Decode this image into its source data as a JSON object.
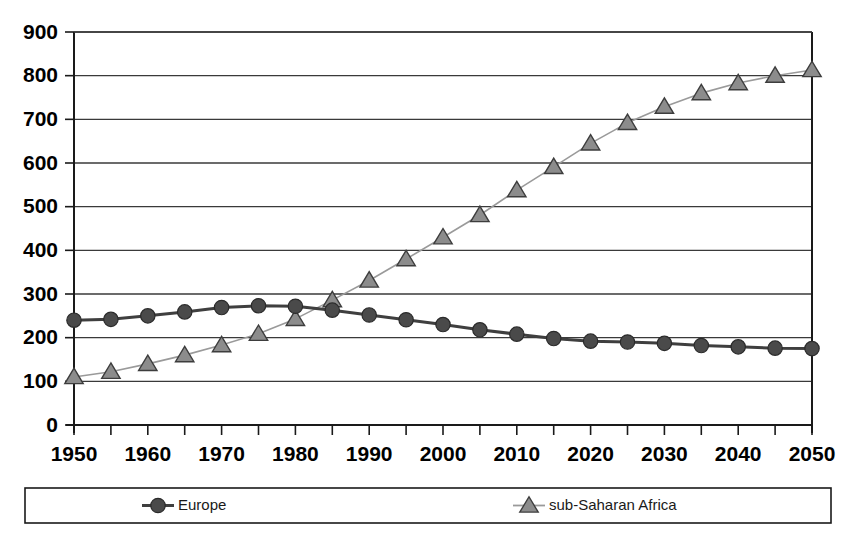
{
  "chart_data": {
    "type": "line",
    "title": "",
    "subtitle": "",
    "xlabel": "",
    "ylabel": "",
    "xlim": [
      1950,
      2050
    ],
    "ylim": [
      0,
      900
    ],
    "grid": true,
    "legend_position": "bottom",
    "x": [
      1950,
      1955,
      1960,
      1965,
      1970,
      1975,
      1980,
      1985,
      1990,
      1995,
      2000,
      2005,
      2010,
      2015,
      2020,
      2025,
      2030,
      2035,
      2040,
      2045,
      2050
    ],
    "x_tick_labels": [
      "1950",
      "1960",
      "1970",
      "1980",
      "1990",
      "2000",
      "2010",
      "2020",
      "2030",
      "2040",
      "2050"
    ],
    "x_tick_values": [
      1950,
      1960,
      1970,
      1980,
      1990,
      2000,
      2010,
      2020,
      2030,
      2040,
      2050
    ],
    "x_minor_tick_values": [
      1955,
      1965,
      1975,
      1985,
      1995,
      2005,
      2015,
      2025,
      2035,
      2045
    ],
    "y_tick_labels": [
      "0",
      "100",
      "200",
      "300",
      "400",
      "500",
      "600",
      "700",
      "800",
      "900"
    ],
    "y_tick_values": [
      0,
      100,
      200,
      300,
      400,
      500,
      600,
      700,
      800,
      900
    ],
    "series": [
      {
        "name": "Europe",
        "marker": "circle",
        "color": "#4a4a4a",
        "line_width": 3,
        "values": [
          240,
          242,
          250,
          259,
          269,
          273,
          272,
          263,
          252,
          241,
          230,
          218,
          208,
          198,
          192,
          190,
          187,
          182,
          179,
          176,
          175
        ]
      },
      {
        "name": "sub-Saharan Africa",
        "marker": "triangle",
        "color": "#8c8c8c",
        "line_width": 1.6,
        "values": [
          110,
          122,
          140,
          160,
          183,
          209,
          243,
          286,
          331,
          380,
          430,
          481,
          538,
          591,
          645,
          692,
          729,
          760,
          783,
          800,
          813
        ]
      }
    ]
  },
  "legend": {
    "entries": [
      {
        "label": "Europe",
        "marker": "circle",
        "color": "#4a4a4a"
      },
      {
        "label": "sub-Saharan Africa",
        "marker": "triangle",
        "color": "#8c8c8c"
      }
    ]
  },
  "colors": {
    "europe": "#4a4a4a",
    "africa": "#8c8c8c",
    "axis": "#1a1a1a",
    "grid": "#3a3a3a",
    "background": "#ffffff"
  }
}
